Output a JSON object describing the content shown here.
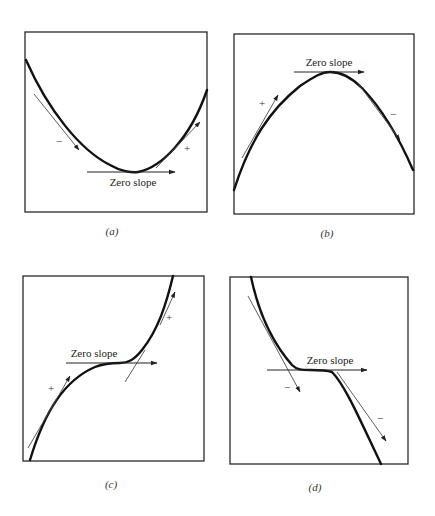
{
  "figure": {
    "panels": [
      {
        "id": "a",
        "caption": "(a)",
        "description": "Concave-up curve (minimum)",
        "zero_slope_label": "Zero slope",
        "left_tangent_sign": "−",
        "right_tangent_sign": "+"
      },
      {
        "id": "b",
        "caption": "(b)",
        "description": "Concave-down curve (maximum)",
        "zero_slope_label": "Zero slope",
        "left_tangent_sign": "+",
        "right_tangent_sign": "−"
      },
      {
        "id": "c",
        "caption": "(c)",
        "description": "Increasing curve with horizontal inflection point",
        "zero_slope_label": "Zero slope",
        "left_tangent_sign": "+",
        "right_tangent_sign": "+"
      },
      {
        "id": "d",
        "caption": "(d)",
        "description": "Decreasing curve with horizontal inflection point",
        "zero_slope_label": "Zero slope",
        "left_tangent_sign": "−",
        "right_tangent_sign": "−"
      }
    ],
    "colors": {
      "curve": "#111111",
      "tangent": "#4a4a4a",
      "frame": "#2a2a2a",
      "background": "#ffffff"
    }
  }
}
